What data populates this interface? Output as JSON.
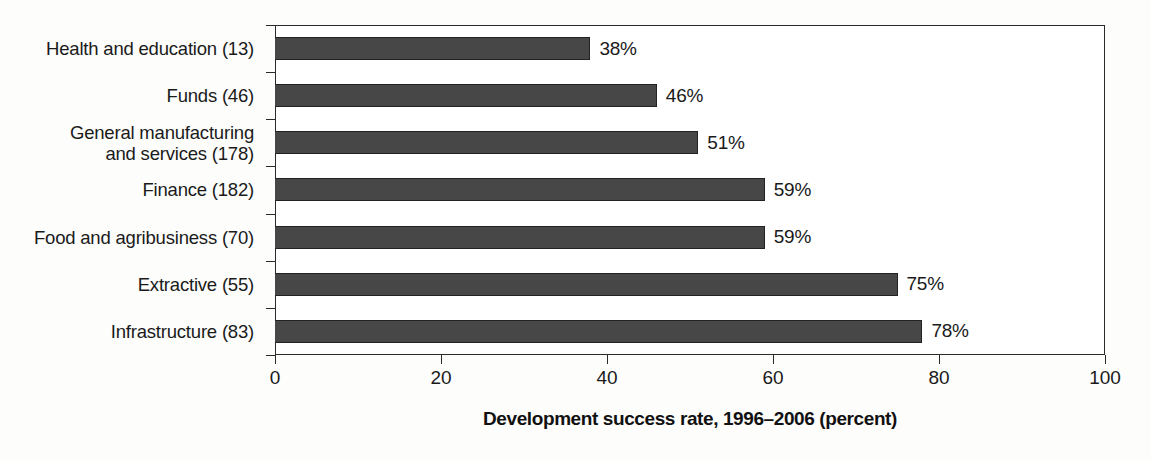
{
  "chart_data": {
    "type": "bar",
    "orientation": "horizontal",
    "title": "",
    "xlabel": "Development success rate, 1996–2006 (percent)",
    "ylabel": "",
    "xlim": [
      0,
      100
    ],
    "xticks": [
      "0",
      "20",
      "40",
      "60",
      "80",
      "100"
    ],
    "grid": false,
    "legend": null,
    "bar_color": "#474747",
    "bar_edge_color": "#222222",
    "categories": [
      "Health and education (13)",
      "Funds (46)",
      "General manufacturing and services (178)",
      "Finance (182)",
      "Food and agribusiness (70)",
      "Extractive (55)",
      "Infrastructure (83)"
    ],
    "category_lines": [
      [
        "Health and education (13)"
      ],
      [
        "Funds (46)"
      ],
      [
        "General manufacturing",
        "and services (178)"
      ],
      [
        "Finance (182)"
      ],
      [
        "Food and agribusiness (70)"
      ],
      [
        "Extractive (55)"
      ],
      [
        "Infrastructure (83)"
      ]
    ],
    "values": [
      38,
      46,
      51,
      59,
      59,
      75,
      78
    ],
    "data_labels": [
      "38%",
      "46%",
      "51%",
      "59%",
      "59%",
      "75%",
      "78%"
    ]
  }
}
